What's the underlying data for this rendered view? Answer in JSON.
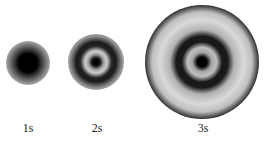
{
  "orbitals": [
    {
      "label": "1s",
      "cx": 28,
      "cy": 63,
      "r": 20
    },
    {
      "label": "2s",
      "cx": 96,
      "cy": 62,
      "r": 27
    },
    {
      "label": "3s",
      "cx": 202,
      "cy": 62,
      "r": 56
    }
  ]
}
